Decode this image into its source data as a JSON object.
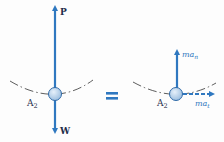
{
  "left_figure": {
    "force_up_label": "P",
    "force_down_label": "W",
    "point_label_base": "A",
    "point_label_sub": "2"
  },
  "equals_symbol": "=",
  "right_figure": {
    "normal_label_base": "ma",
    "normal_label_sub": "n",
    "tangential_label_base": "ma",
    "tangential_label_sub": "t",
    "point_label_base": "A",
    "point_label_sub": "2"
  },
  "colors": {
    "arrow": "#2f78c0",
    "ball_fill": "#b9d3ec",
    "ball_stroke": "#2f6aa8",
    "path": "#333333",
    "text": "#1f2d4a"
  }
}
